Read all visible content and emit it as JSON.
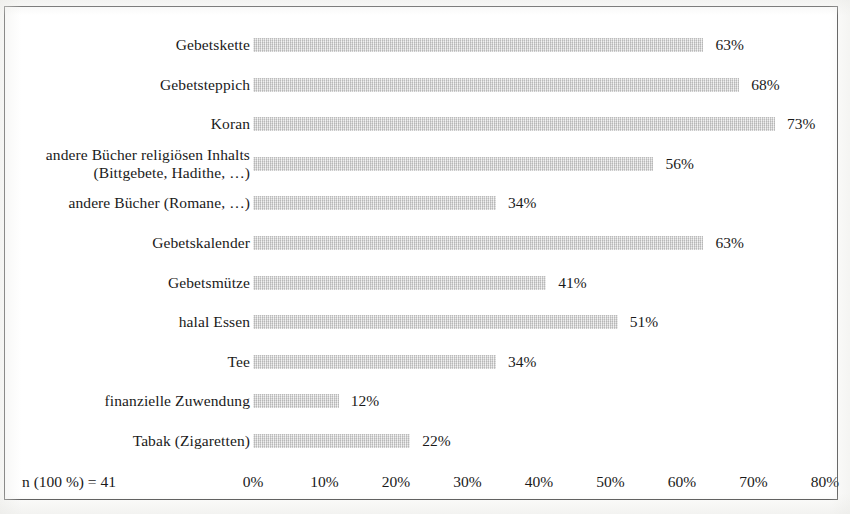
{
  "figure": {
    "sample_size_note": "n (100 %) = 41",
    "bar_color": "#d3d3d3",
    "frame_color": "#4a4a4a",
    "background_color": "#ffffff"
  },
  "chart_data": {
    "type": "bar",
    "orientation": "horizontal",
    "title": "",
    "subtitle": "",
    "xlabel": "",
    "ylabel": "",
    "xlim": [
      0,
      80
    ],
    "grid": false,
    "legend": false,
    "value_suffix": "%",
    "categories": [
      "Gebetskette",
      "Gebetsteppich",
      "Koran",
      "andere Bücher religiösen Inhalts (Bittgebete, Hadithe, …)",
      "andere Bücher (Romane, …)",
      "Gebetskalender",
      "Gebetsmütze",
      "halal Essen",
      "Tee",
      "finanzielle Zuwendung",
      "Tabak (Zigaretten)"
    ],
    "category_lines": [
      [
        "Gebetskette"
      ],
      [
        "Gebetsteppich"
      ],
      [
        "Koran"
      ],
      [
        "andere Bücher religiösen Inhalts",
        "(Bittgebete, Hadithe, …)"
      ],
      [
        "andere Bücher (Romane, …)"
      ],
      [
        "Gebetskalender"
      ],
      [
        "Gebetsmütze"
      ],
      [
        "halal Essen"
      ],
      [
        "Tee"
      ],
      [
        "finanzielle Zuwendung"
      ],
      [
        "Tabak (Zigaretten)"
      ]
    ],
    "values": [
      63,
      68,
      73,
      56,
      34,
      63,
      41,
      51,
      34,
      12,
      22
    ],
    "value_labels": [
      "63%",
      "68%",
      "73%",
      "56%",
      "34%",
      "63%",
      "41%",
      "51%",
      "34%",
      "12%",
      "22%"
    ],
    "xticks": [
      0,
      10,
      20,
      30,
      40,
      50,
      60,
      70,
      80
    ],
    "xtick_labels": [
      "0%",
      "10%",
      "20%",
      "30%",
      "40%",
      "50%",
      "60%",
      "70%",
      "80%"
    ]
  }
}
